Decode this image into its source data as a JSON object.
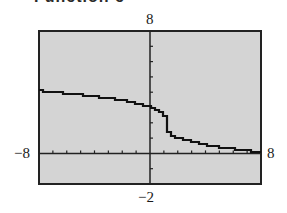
{
  "header": {
    "title_partial": "Function c"
  },
  "chart_data": {
    "type": "line",
    "title": "",
    "xlabel": "",
    "ylabel": "",
    "xlim": [
      -8,
      8
    ],
    "ylim": [
      -2,
      8
    ],
    "x_tick_step": 1,
    "y_tick_step": 1,
    "grid": false,
    "window_labels": {
      "ymax": "8",
      "ymin": "-2",
      "xmin": "-8",
      "xmax": "8"
    },
    "background": "#d4d4d4",
    "line_color": "#111111",
    "function_estimate": "y = 2 - cbrt(x - 1)",
    "series": [
      {
        "name": "f(x)",
        "x": [
          -8,
          -7,
          -6,
          -5,
          -4,
          -3,
          -2,
          -1,
          -0.5,
          0,
          0.5,
          0.8,
          1,
          1.2,
          1.5,
          2,
          3,
          4,
          5,
          6,
          7,
          8
        ],
        "y": [
          4.08,
          4.0,
          3.91,
          3.82,
          3.71,
          3.59,
          3.44,
          3.26,
          3.14,
          3.0,
          2.79,
          2.58,
          2.0,
          1.42,
          1.21,
          1.0,
          0.74,
          0.56,
          0.41,
          0.29,
          0.18,
          0.09
        ]
      }
    ]
  }
}
